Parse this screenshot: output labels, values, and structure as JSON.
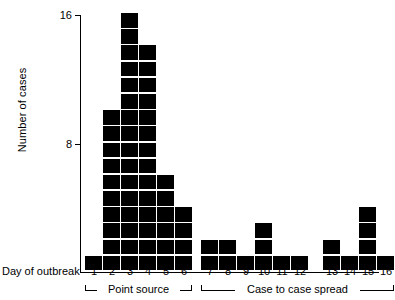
{
  "chart_data": {
    "type": "bar",
    "title": "",
    "subtitle": "",
    "xlabel": "Day of outbreak",
    "ylabel": "Number of cases",
    "categories": [
      "1",
      "2",
      "3",
      "4",
      "5",
      "6",
      "7",
      "8",
      "9",
      "10",
      "11",
      "12",
      "13",
      "14",
      "15",
      "16"
    ],
    "values": [
      1,
      10,
      16,
      14,
      6,
      4,
      2,
      2,
      1,
      3,
      1,
      1,
      2,
      1,
      4,
      1
    ],
    "series": [
      {
        "name": "Cases",
        "values": [
          1,
          10,
          16,
          14,
          6,
          4,
          2,
          2,
          1,
          3,
          1,
          1,
          2,
          1,
          4,
          1
        ]
      }
    ],
    "ylim": [
      0,
      16
    ],
    "ytick_values": [
      8,
      16
    ],
    "ytick_labels": [
      "8",
      "16"
    ],
    "grid": false,
    "legend": false,
    "style": "stacked unit blocks (one filled square per case)",
    "block_color": "#000000",
    "annotations": [
      {
        "label": "Point source",
        "covers_days": [
          "1",
          "6"
        ]
      },
      {
        "label": "Case to case spread",
        "covers_days": [
          "7",
          "16"
        ]
      }
    ]
  },
  "axes": {
    "y_label": "Number of cases",
    "y_ticks": [
      {
        "value": 16,
        "label": "16"
      },
      {
        "value": 8,
        "label": "8"
      }
    ],
    "x_label": "Day of outbreak",
    "x_ticks": [
      "1",
      "2",
      "3",
      "4",
      "5",
      "6",
      "7",
      "8",
      "9",
      "10",
      "11",
      "12",
      "13",
      "14",
      "15",
      "16"
    ]
  },
  "groups": [
    {
      "label": "Point source",
      "first_day": "1",
      "last_day": "6"
    },
    {
      "label": "Case to case spread",
      "first_day": "7",
      "last_day": "16"
    }
  ],
  "colors": {
    "block": "#000000",
    "axis": "#000000",
    "background": "#ffffff"
  }
}
